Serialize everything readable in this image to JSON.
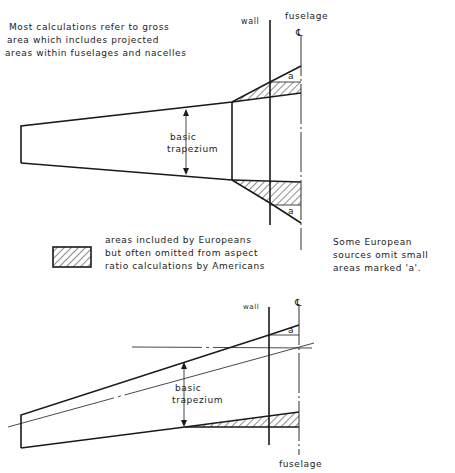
{
  "top_note": {
    "lines": [
      "Most calculations refer to gross",
      "area which includes projected",
      "areas within fuselages and nacelles"
    ]
  },
  "top_diagram": {
    "wall_label": "wall",
    "fuselage_label": "fuselage",
    "centerline_symbol": "℄",
    "trapezium_label_1": "basic",
    "trapezium_label_2": "trapezium",
    "area_a_upper": "a",
    "area_a_lower": "a"
  },
  "legend": {
    "lines": [
      "areas included by Europeans",
      "but often omitted from aspect",
      "ratio calculations by Americans"
    ]
  },
  "side_note": {
    "lines": [
      "Some European",
      "sources omit small",
      "areas marked 'a'."
    ]
  },
  "bottom_diagram": {
    "wall_label": "wall",
    "fuselage_label": "fuselage",
    "centerline_symbol": "℄",
    "trapezium_label_1": "basic",
    "trapezium_label_2": "trapezium",
    "area_a": "a"
  },
  "colors": {
    "ink": "#1a1a1a",
    "background": "#ffffff"
  }
}
